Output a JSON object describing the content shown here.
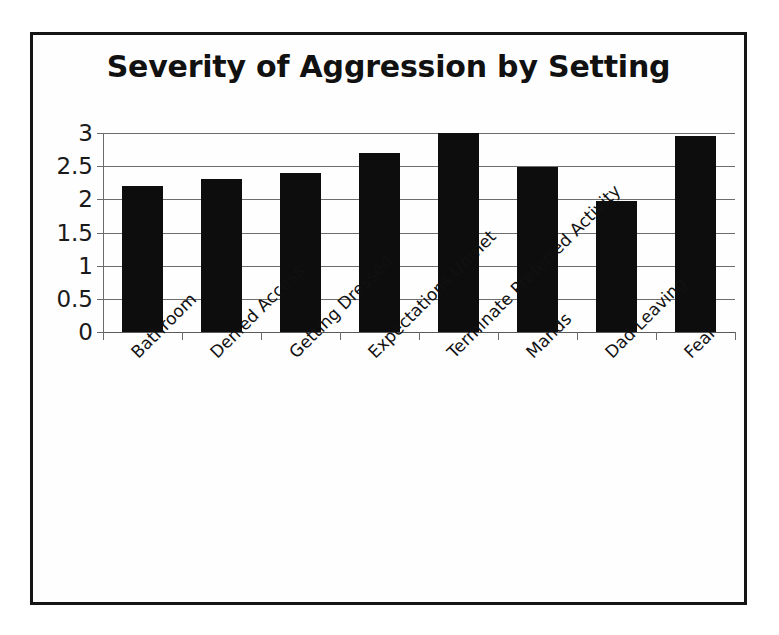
{
  "chart_data": {
    "type": "bar",
    "title": "Severity of Aggression by Setting",
    "xlabel": "",
    "ylabel": "",
    "categories": [
      "Bathroom",
      "Denied Access",
      "Getting Dressed",
      "Expectations Unmet",
      "Terminate Preferred Activity",
      "Mands",
      "Dad Leaving",
      "Fear"
    ],
    "values": [
      2.2,
      2.3,
      2.4,
      2.7,
      3.0,
      2.48,
      1.97,
      2.95
    ],
    "ylim": [
      0,
      3
    ],
    "ytick_labels": [
      "3",
      "2.5",
      "2",
      "1.5",
      "1",
      "0.5",
      "0"
    ],
    "ytick_values": [
      3,
      2.5,
      2,
      1.5,
      1,
      0.5,
      0
    ],
    "grid": true,
    "legend": false,
    "legend_position": "none",
    "bar_color": "#0d0d0d",
    "gridline_color": "#6e6e6e",
    "axis_color": "#6a6a6a",
    "border_color": "#151515",
    "background_color": "#ffffff",
    "label_rotation_deg": -45
  }
}
